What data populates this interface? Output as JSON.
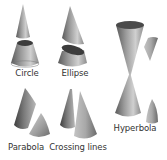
{
  "diagram": {
    "colors": {
      "background": "#ffffff",
      "cone_light": "#c8c8c8",
      "cone_mid": "#8a8a8a",
      "cone_dark": "#4a4a4a",
      "cut_face": "#3c3c3c",
      "label": "#333333"
    },
    "sections": [
      {
        "id": "circle",
        "label": "Circle",
        "label_pos": [
          27,
          72
        ]
      },
      {
        "id": "ellipse",
        "label": "Ellipse",
        "label_pos": [
          75,
          72
        ]
      },
      {
        "id": "hyperbola",
        "label": "Hyperbola",
        "label_pos": [
          134,
          127
        ]
      },
      {
        "id": "parabola",
        "label": "Parabola",
        "label_pos": [
          26,
          147
        ]
      },
      {
        "id": "crossing-lines",
        "label": "Crossing lines",
        "label_pos": [
          78,
          147
        ]
      }
    ]
  }
}
